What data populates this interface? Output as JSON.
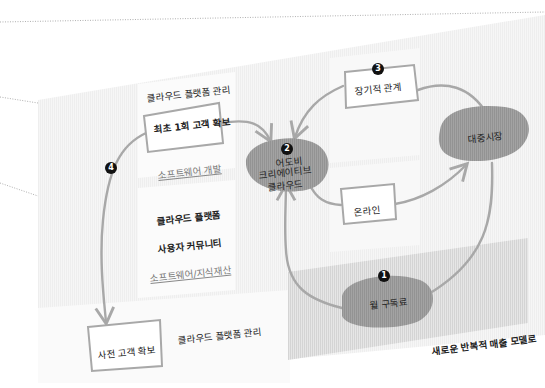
{
  "diagram": {
    "type": "cycle-flow",
    "nodes": {
      "first_acquisition": {
        "label": "최초 1회 고객 확보",
        "shape": "box"
      },
      "adobe_cc": {
        "label_lines": [
          "어도비",
          "크리에이티브",
          "클라우드"
        ],
        "shape": "blob",
        "badge": "2"
      },
      "regular_relationship": {
        "label": "장기적 관계",
        "shape": "box",
        "badge": "3"
      },
      "mass_market": {
        "label": "대중시장",
        "shape": "blob"
      },
      "online": {
        "label": "온라인",
        "shape": "box"
      },
      "monthly_subscription": {
        "label": "월 구독료",
        "shape": "blob",
        "badge": "1"
      },
      "pre_acquisition": {
        "label": "사전 고객 확보",
        "shape": "box"
      }
    },
    "badges": {
      "b1": "1",
      "b2": "2",
      "b3": "3",
      "b4": "4"
    },
    "labels": {
      "top_platform_mgmt": "클라우드 플랫폼 관리",
      "software_dev": "소프트웨어 개발",
      "cloud_platform": "클라우드 플랫폼",
      "user_community": "사용자 커뮤니티",
      "software_ip": "소프트웨어/지식재산",
      "bottom_platform_mgmt": "클라우드 플랫폼 관리",
      "new_model": "새로운 반복적 매출 모델로"
    },
    "edges": [
      {
        "from": "first_acquisition",
        "to": "adobe_cc"
      },
      {
        "from": "regular_relationship",
        "to": "adobe_cc"
      },
      {
        "from": "adobe_cc",
        "to": "online"
      },
      {
        "from": "online",
        "to": "mass_market"
      },
      {
        "from": "mass_market",
        "to": "regular_relationship"
      },
      {
        "from": "mass_market",
        "to": "monthly_subscription"
      },
      {
        "from": "monthly_subscription",
        "to": "adobe_cc"
      },
      {
        "from": "first_acquisition",
        "to": "pre_acquisition",
        "badge": "4"
      }
    ],
    "colors": {
      "blob_fill": "#9a9a9a",
      "panel_light": "#f4f4f4",
      "panel_shaded": "#dcdcdc",
      "arrow": "#a8a8a8",
      "badge": "#111111"
    }
  }
}
